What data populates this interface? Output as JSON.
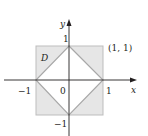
{
  "diagram": {
    "region_label": "D",
    "point_label": "(1, 1)",
    "axes": {
      "x_label": "x",
      "y_label": "y"
    },
    "ticks": {
      "x_neg": "−1",
      "x_pos": "1",
      "origin": "0",
      "y_pos": "1",
      "y_neg": "−1"
    },
    "shapes": {
      "square": "[-1,1] x [-1,1]",
      "diamond": "|x| + |y| = 1"
    },
    "colors": {
      "fill": "#e6e6e6",
      "square_edge": "#bdbdbd",
      "diamond_edge": "#a8a8a8",
      "axis": "#231f20",
      "inner": "#ffffff"
    }
  }
}
